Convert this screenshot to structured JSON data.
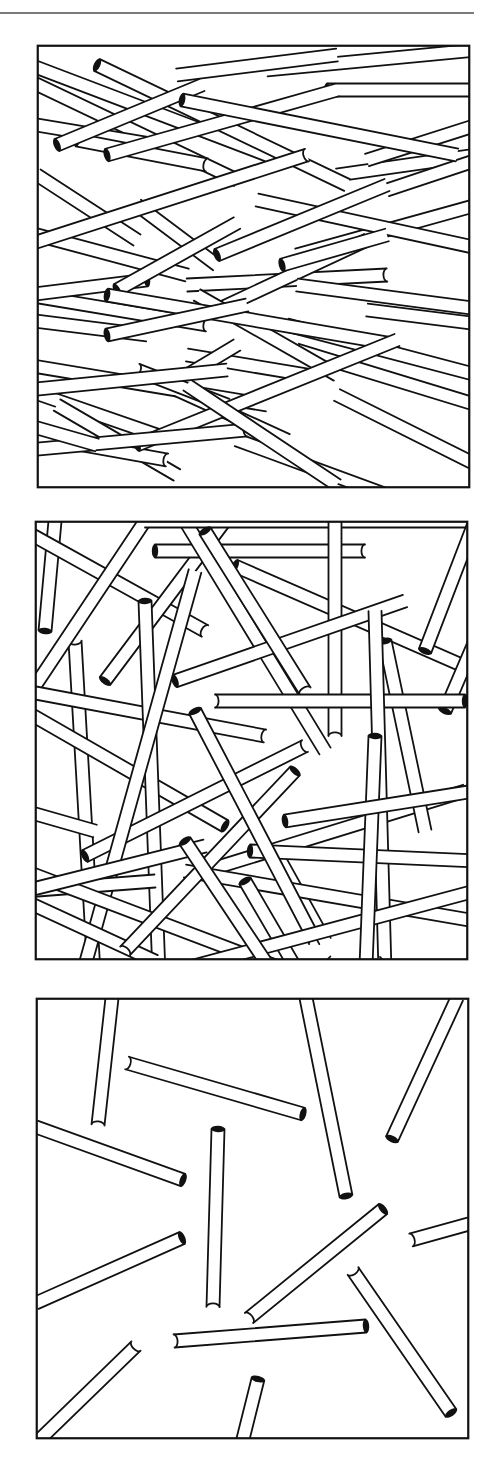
{
  "figure": {
    "rule_color": "#7a7a7a",
    "ink_color": "#111111",
    "paper_color": "#ffffff",
    "rod_width": 13,
    "panels": [
      {
        "id": "dense",
        "label": "High density rod packing",
        "frame": {
          "x": 37,
          "y": 45,
          "w": 433,
          "h": 443
        },
        "rods": [
          [
            -20,
            15,
            230,
            110,
            "none",
            "none"
          ],
          [
            -20,
            30,
            200,
            135,
            "none",
            "none"
          ],
          [
            0,
            80,
            120,
            100,
            "none",
            "open"
          ],
          [
            40,
            95,
            170,
            120,
            "dark",
            "open"
          ],
          [
            0,
            130,
            100,
            195,
            "none",
            "none"
          ],
          [
            0,
            190,
            150,
            230,
            "none",
            "none"
          ],
          [
            -10,
            250,
            170,
            280,
            "none",
            "open"
          ],
          [
            -10,
            275,
            110,
            290,
            "none",
            "none"
          ],
          [
            100,
            160,
            180,
            220,
            "none",
            "none"
          ],
          [
            150,
            310,
            270,
            330,
            "none",
            "none"
          ],
          [
            -10,
            320,
            230,
            360,
            "none",
            "none"
          ],
          [
            -10,
            345,
            120,
            390,
            "none",
            "none"
          ],
          [
            20,
            360,
            140,
            430,
            "none",
            "none"
          ],
          [
            -10,
            390,
            130,
            415,
            "none",
            "open"
          ],
          [
            140,
            345,
            250,
            395,
            "none",
            "none"
          ],
          [
            200,
            395,
            350,
            450,
            "none",
            "none"
          ],
          [
            300,
            350,
            440,
            420,
            "none",
            "none"
          ],
          [
            250,
            280,
            440,
            330,
            "none",
            "none"
          ],
          [
            260,
            305,
            440,
            360,
            "none",
            "none"
          ],
          [
            230,
            25,
            440,
            5,
            "none",
            "none"
          ],
          [
            140,
            30,
            300,
            10,
            "none",
            "none"
          ],
          [
            300,
            130,
            440,
            110,
            "none",
            "none"
          ],
          [
            330,
            115,
            440,
            80,
            "none",
            "none"
          ],
          [
            350,
            145,
            440,
            115,
            "none",
            "none"
          ],
          [
            260,
            210,
            440,
            160,
            "none",
            "open"
          ],
          [
            150,
            240,
            350,
            230,
            "none",
            "open"
          ],
          [
            180,
            265,
            330,
            195,
            "dark",
            "open"
          ],
          [
            220,
            155,
            450,
            205,
            "none",
            "none"
          ],
          [
            260,
            240,
            450,
            265,
            "none",
            "none"
          ],
          [
            330,
            265,
            450,
            280,
            "none",
            "none"
          ],
          [
            160,
            250,
            300,
            330,
            "none",
            "none"
          ],
          [
            -10,
            250,
            110,
            235,
            "none",
            "dark"
          ],
          [
            60,
            20,
            310,
            140,
            "dark",
            "none"
          ],
          [
            290,
            45,
            440,
            45,
            "dark",
            "none"
          ],
          [
            70,
            110,
            300,
            45,
            "dark",
            "none"
          ],
          [
            20,
            100,
            165,
            40,
            "dark",
            "none"
          ],
          [
            -10,
            200,
            270,
            110,
            "none",
            "open"
          ],
          [
            145,
            55,
            420,
            110,
            "dark",
            "none"
          ],
          [
            180,
            210,
            350,
            140,
            "dark",
            "none"
          ],
          [
            80,
            245,
            200,
            178,
            "dark",
            "none"
          ],
          [
            245,
            220,
            350,
            190,
            "dark",
            "none"
          ],
          [
            70,
            250,
            350,
            298,
            "dark",
            "open"
          ],
          [
            70,
            290,
            210,
            260,
            "dark",
            "none"
          ],
          [
            100,
            325,
            190,
            360,
            "open",
            "none"
          ],
          [
            150,
            330,
            200,
            300,
            "dark",
            "none"
          ],
          [
            100,
            400,
            360,
            295,
            "dark",
            "none"
          ],
          [
            -10,
            405,
            210,
            385,
            "none",
            "open"
          ],
          [
            150,
            340,
            300,
            440,
            "none",
            "none"
          ],
          [
            -10,
            345,
            190,
            325,
            "none",
            "none"
          ],
          [
            -10,
            380,
            60,
            400,
            "none",
            "none"
          ]
        ]
      },
      {
        "id": "medium",
        "label": "Medium density rod packing",
        "frame": {
          "x": 35,
          "y": 521,
          "w": 433,
          "h": 439
        },
        "rods": [
          [
            20,
            0,
            10,
            110,
            "none",
            "dark"
          ],
          [
            40,
            120,
            60,
            470,
            "open",
            "none"
          ],
          [
            -10,
            10,
            170,
            110,
            "none",
            "open"
          ],
          [
            -10,
            180,
            110,
            0,
            "none",
            "none"
          ],
          [
            70,
            160,
            190,
            0,
            "dark",
            "none"
          ],
          [
            120,
            30,
            330,
            30,
            "dark",
            "open"
          ],
          [
            150,
            0,
            290,
            230,
            "dark",
            "none"
          ],
          [
            -10,
            170,
            230,
            215,
            "none",
            "open"
          ],
          [
            -10,
            190,
            190,
            305,
            "none",
            "dark"
          ],
          [
            110,
            0,
            440,
            0,
            "none",
            "none"
          ],
          [
            200,
            45,
            440,
            150,
            "dark",
            "none"
          ],
          [
            300,
            0,
            300,
            215,
            "none",
            "open"
          ],
          [
            390,
            130,
            440,
            0,
            "dark",
            "none"
          ],
          [
            410,
            190,
            440,
            120,
            "dark",
            "none"
          ],
          [
            140,
            160,
            370,
            80,
            "dark",
            "none"
          ],
          [
            110,
            80,
            125,
            480,
            "dark",
            "open"
          ],
          [
            170,
            10,
            270,
            170,
            "dark",
            "open"
          ],
          [
            -10,
            290,
            60,
            310,
            "none",
            "none"
          ],
          [
            50,
            335,
            270,
            225,
            "dark",
            "open"
          ],
          [
            170,
            350,
            430,
            270,
            "dark",
            "none"
          ],
          [
            240,
            330,
            290,
            420,
            "none",
            "none"
          ],
          [
            180,
            565,
            300,
            440,
            "none",
            "none"
          ],
          [
            160,
            50,
            40,
            480,
            "none",
            "none"
          ],
          [
            -10,
            370,
            120,
            360,
            "none",
            "none"
          ],
          [
            -10,
            380,
            120,
            440,
            "none",
            "none"
          ],
          [
            -10,
            350,
            280,
            460,
            "none",
            "none"
          ],
          [
            350,
            120,
            390,
            310,
            "dark",
            "none"
          ],
          [
            180,
            180,
            430,
            180,
            "open",
            "dark"
          ],
          [
            150,
            350,
            440,
            400,
            "none",
            "none"
          ],
          [
            90,
            430,
            260,
            250,
            "open",
            "dark"
          ],
          [
            340,
            90,
            350,
            450,
            "none",
            "none"
          ],
          [
            -10,
            370,
            170,
            325,
            "none",
            "none"
          ],
          [
            215,
            330,
            440,
            340,
            "dark",
            "none"
          ],
          [
            160,
            190,
            280,
            420,
            "dark",
            "open"
          ],
          [
            210,
            360,
            280,
            480,
            "dark",
            "none"
          ],
          [
            -10,
            490,
            440,
            370,
            "none",
            "none"
          ],
          [
            340,
            215,
            330,
            470,
            "dark",
            "none"
          ],
          [
            340,
            440,
            440,
            560,
            "none",
            "none"
          ],
          [
            -10,
            440,
            70,
            560,
            "none",
            "none"
          ],
          [
            150,
            320,
            230,
            440,
            "dark",
            "none"
          ],
          [
            250,
            300,
            440,
            270,
            "dark",
            "none"
          ],
          [
            240,
            620,
            360,
            500,
            "none",
            "none"
          ]
        ]
      },
      {
        "id": "sparse",
        "label": "Low density rod packing",
        "frame": {
          "x": 36,
          "y": 998,
          "w": 433,
          "h": 441
        },
        "rods": [
          [
            76,
            0,
            62,
            127,
            "none",
            "open"
          ],
          [
            91,
            65,
            267,
            116,
            "open",
            "dark"
          ],
          [
            270,
            0,
            310,
            198,
            "none",
            "dark"
          ],
          [
            421,
            0,
            356,
            141,
            "none",
            "dark"
          ],
          [
            0,
            129,
            147,
            182,
            "none",
            "dark"
          ],
          [
            182,
            131,
            177,
            309,
            "dark",
            "open"
          ],
          [
            0,
            305,
            146,
            240,
            "none",
            "dark"
          ],
          [
            213,
            320,
            347,
            211,
            "open",
            "dark"
          ],
          [
            375,
            242,
            433,
            226,
            "open",
            "none"
          ],
          [
            317,
            273,
            415,
            415,
            "open",
            "dark"
          ],
          [
            100,
            348,
            0,
            445,
            "open",
            "none"
          ],
          [
            138,
            343,
            330,
            328,
            "open",
            "dark"
          ],
          [
            222,
            381,
            206,
            445,
            "dark",
            "none"
          ]
        ]
      }
    ]
  }
}
